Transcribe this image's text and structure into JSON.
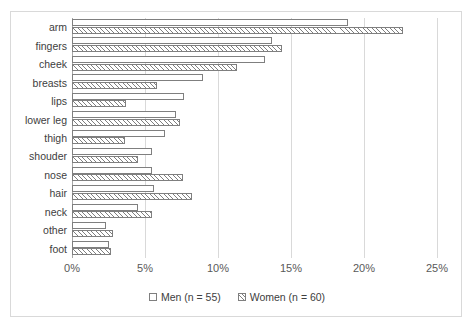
{
  "chart_data": {
    "type": "bar",
    "orientation": "horizontal",
    "title": "",
    "xlabel": "",
    "ylabel": "",
    "xlim": [
      0,
      25
    ],
    "xticks": [
      "0%",
      "5%",
      "10%",
      "15%",
      "20%",
      "25%"
    ],
    "xtick_values": [
      0,
      5,
      10,
      15,
      20,
      25
    ],
    "grid": true,
    "legend_position": "bottom",
    "categories": [
      "arm",
      "fingers",
      "cheek",
      "breasts",
      "lips",
      "lower leg",
      "thigh",
      "shouder",
      "nose",
      "hair",
      "neck",
      "other",
      "foot"
    ],
    "series": [
      {
        "name": "Men (n = 55)",
        "values": [
          18.9,
          13.7,
          13.2,
          9.0,
          7.7,
          7.1,
          6.4,
          5.5,
          5.5,
          5.6,
          4.5,
          2.3,
          2.5
        ]
      },
      {
        "name": "Women (n = 60)",
        "values": [
          22.7,
          14.4,
          11.3,
          5.8,
          3.7,
          7.4,
          3.6,
          4.5,
          7.6,
          8.2,
          5.5,
          2.8,
          2.7
        ]
      }
    ]
  },
  "legend": {
    "items": [
      {
        "label": "Men (n = 55)",
        "swatch": "empty-square"
      },
      {
        "label": "Women (n = 60)",
        "swatch": "hatched-square"
      }
    ]
  },
  "colors": {
    "bar_outline": "#7f7f7f",
    "gridline": "#d9d9d9",
    "axis": "#a6a6a6",
    "text": "#404040",
    "tick_text": "#595959",
    "background": "#ffffff"
  }
}
